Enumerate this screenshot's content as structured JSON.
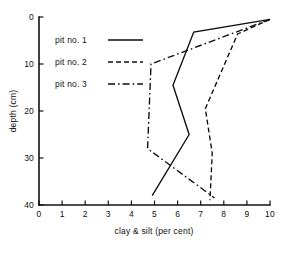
{
  "chart_data": {
    "type": "line",
    "title": "",
    "xlabel": "clay & silt  (per cent)",
    "ylabel": "depth (cm)",
    "xlim": [
      0,
      10
    ],
    "ylim": [
      0,
      40
    ],
    "y_inverted": true,
    "grid": false,
    "legend_position": "top-left",
    "xticks": [
      0,
      1,
      2,
      3,
      4,
      5,
      6,
      7,
      8,
      9,
      10
    ],
    "xtick_labels": [
      "0",
      "1",
      "2",
      "3",
      "4",
      "5",
      "6",
      "7",
      "8",
      "9",
      "10"
    ],
    "yticks": [
      0,
      10,
      20,
      30,
      40
    ],
    "ytick_labels": [
      "0",
      "10",
      "20",
      "30",
      "40"
    ],
    "series": [
      {
        "name": "pit no. 1",
        "style": "solid",
        "dasharray": "",
        "x": [
          10.0,
          6.7,
          5.8,
          6.5,
          4.9
        ],
        "depth": [
          0.5,
          3.2,
          14.5,
          25.0,
          38.0
        ]
      },
      {
        "name": "pit no. 2",
        "style": "dashed",
        "dasharray": "5,3",
        "x": [
          10.0,
          8.6,
          7.2,
          7.5,
          7.4
        ],
        "depth": [
          0.5,
          3.6,
          19.5,
          29.0,
          39.0
        ]
      },
      {
        "name": "pit no. 3",
        "style": "dash-dot",
        "dasharray": "7,3,1.6,3",
        "x": [
          10.0,
          4.85,
          4.7,
          7.6
        ],
        "depth": [
          0.5,
          10.0,
          28.0,
          38.5
        ]
      }
    ]
  },
  "legend": {
    "items": [
      {
        "label": "pit no. 1"
      },
      {
        "label": "pit no. 2"
      },
      {
        "label": "pit no. 3"
      }
    ]
  },
  "axes": {
    "x_title": "clay & silt  (per cent)",
    "y_title": "depth (cm)"
  }
}
